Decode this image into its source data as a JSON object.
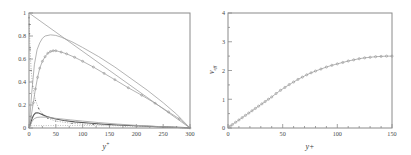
{
  "figure": {
    "background": "#ffffff",
    "axis_color": "#8a8a8a",
    "curve_color": "#9b9b9b",
    "dark_curve_color": "#5a5a5a"
  },
  "chart_data": [
    {
      "type": "line",
      "panel": "left",
      "title": "",
      "xlabel": "y+",
      "ylabel": "",
      "xlim": [
        0,
        300
      ],
      "ylim": [
        0,
        1
      ],
      "xticks": [
        0,
        50,
        100,
        150,
        200,
        250,
        300
      ],
      "xticklabels": [
        "0",
        "50",
        "100",
        "150",
        "200",
        "250",
        "300"
      ],
      "yticks": [
        0,
        0.2,
        0.4,
        0.6,
        0.8,
        1
      ],
      "yticklabels": [
        "0",
        "0.2",
        "0.4",
        "0.6",
        "0.8",
        "1"
      ],
      "grid": false,
      "legend": "none",
      "series": [
        {
          "name": "total-stress",
          "style": "solid-thin",
          "x": [
            0,
            300
          ],
          "values": [
            1.0,
            0.0
          ]
        },
        {
          "name": "viscous-stress",
          "style": "dotted-vertical",
          "x": [
            0,
            0,
            0.5,
            1,
            2,
            4,
            7,
            12,
            18,
            25,
            35,
            50,
            80,
            120,
            180,
            250,
            300
          ],
          "values": [
            1.0,
            0.96,
            0.9,
            0.82,
            0.68,
            0.5,
            0.36,
            0.24,
            0.17,
            0.12,
            0.085,
            0.06,
            0.04,
            0.03,
            0.02,
            0.01,
            0.0
          ]
        },
        {
          "name": "reynolds-stress-upper",
          "style": "light-line",
          "x": [
            0,
            5,
            10,
            15,
            20,
            25,
            30,
            40,
            50,
            60,
            80,
            100,
            130,
            160,
            190,
            220,
            250,
            275,
            300
          ],
          "values": [
            0.0,
            0.3,
            0.55,
            0.68,
            0.74,
            0.78,
            0.8,
            0.81,
            0.805,
            0.79,
            0.75,
            0.7,
            0.62,
            0.53,
            0.43,
            0.33,
            0.22,
            0.12,
            0.0
          ]
        },
        {
          "name": "reynolds-stress-model",
          "style": "marker-open",
          "x": [
            0,
            4,
            8,
            12,
            16,
            20,
            25,
            30,
            35,
            40,
            45,
            50,
            60,
            70,
            85,
            100,
            120,
            140,
            160,
            185,
            210,
            235,
            260,
            280,
            300
          ],
          "values": [
            0.0,
            0.1,
            0.22,
            0.34,
            0.44,
            0.52,
            0.58,
            0.62,
            0.65,
            0.665,
            0.672,
            0.672,
            0.66,
            0.645,
            0.615,
            0.58,
            0.53,
            0.475,
            0.42,
            0.35,
            0.285,
            0.215,
            0.14,
            0.08,
            0.0
          ]
        },
        {
          "name": "production-near-wall",
          "style": "dark-bump",
          "x": [
            0,
            2,
            4,
            6,
            9,
            12,
            15,
            18,
            22,
            27,
            33,
            40,
            50,
            65,
            85,
            110,
            140,
            175,
            210,
            250,
            290,
            300
          ],
          "values": [
            0.0,
            0.02,
            0.055,
            0.085,
            0.115,
            0.13,
            0.133,
            0.13,
            0.122,
            0.112,
            0.1,
            0.09,
            0.078,
            0.065,
            0.053,
            0.043,
            0.033,
            0.024,
            0.017,
            0.01,
            0.003,
            0.0
          ]
        },
        {
          "name": "dissipation-tail",
          "style": "mid-line",
          "x": [
            0,
            3,
            6,
            10,
            15,
            22,
            30,
            42,
            58,
            78,
            100,
            130,
            165,
            200,
            240,
            275,
            300
          ],
          "values": [
            0.0,
            0.03,
            0.06,
            0.082,
            0.092,
            0.095,
            0.094,
            0.088,
            0.08,
            0.07,
            0.06,
            0.047,
            0.034,
            0.023,
            0.013,
            0.005,
            0.0
          ]
        },
        {
          "name": "dotted-baseline",
          "style": "dotted-flat",
          "x": [
            0,
            50,
            100,
            150,
            200,
            250,
            300
          ],
          "values": [
            0.02,
            0.022,
            0.022,
            0.02,
            0.016,
            0.01,
            0.0
          ]
        }
      ]
    },
    {
      "type": "scatter",
      "panel": "right",
      "title": "",
      "xlabel": "y+",
      "ylabel": "v_eff",
      "xlim": [
        0,
        150
      ],
      "ylim": [
        0,
        4
      ],
      "xticks": [
        0,
        50,
        100,
        150
      ],
      "xticklabels": [
        "0",
        "50",
        "100",
        "150"
      ],
      "yticks": [
        0,
        1,
        2,
        3,
        4
      ],
      "yticklabels": [
        "0",
        "1",
        "2",
        "3",
        "4"
      ],
      "grid": false,
      "legend": "none",
      "series": [
        {
          "name": "effective-viscosity",
          "style": "marker-open",
          "x": [
            0,
            2,
            4,
            7,
            10,
            13,
            16,
            19,
            22,
            25,
            28,
            31,
            34,
            37,
            40,
            44,
            48,
            52,
            56,
            60,
            64,
            68,
            72,
            76,
            80,
            85,
            90,
            95,
            100,
            105,
            110,
            115,
            120,
            125,
            130,
            135,
            140,
            145,
            150
          ],
          "values": [
            0.0,
            0.06,
            0.12,
            0.2,
            0.28,
            0.36,
            0.44,
            0.52,
            0.6,
            0.68,
            0.76,
            0.84,
            0.92,
            1.0,
            1.08,
            1.2,
            1.31,
            1.41,
            1.51,
            1.6,
            1.69,
            1.77,
            1.85,
            1.92,
            1.98,
            2.05,
            2.12,
            2.18,
            2.23,
            2.28,
            2.33,
            2.37,
            2.41,
            2.44,
            2.46,
            2.48,
            2.49,
            2.5,
            2.5
          ]
        }
      ]
    }
  ],
  "labels": {
    "left_xaxis": "y",
    "left_xaxis_sup": "+",
    "right_xaxis": "y+",
    "right_yaxis": "v",
    "right_yaxis_sub": "eff"
  }
}
